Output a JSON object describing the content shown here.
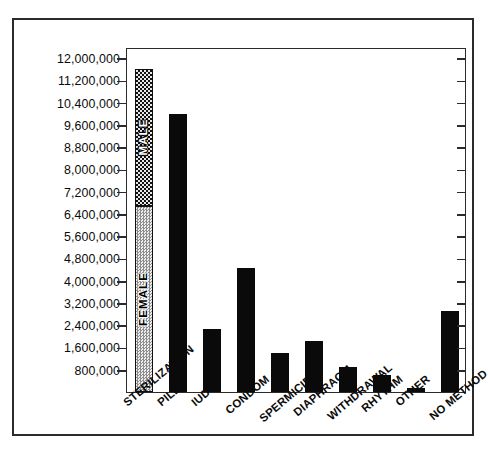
{
  "chart_data": {
    "type": "bar",
    "title": "",
    "subtitle": "",
    "xlabel": "",
    "ylabel": "",
    "grid": false,
    "legend_position": "in-bar",
    "ylim": [
      0,
      12400000
    ],
    "ytick_values": [
      800000,
      1600000,
      2400000,
      3200000,
      4000000,
      4800000,
      5600000,
      6400000,
      7200000,
      8000000,
      8800000,
      9600000,
      10400000,
      11200000,
      12000000
    ],
    "ytick_labels": [
      "800,000",
      "1,600,000",
      "2,400,000",
      "3,200,000",
      "4,000,000",
      "4,800,000",
      "5,600,000",
      "6,400,000",
      "7,200,000",
      "8,000,000",
      "8,800,000",
      "9,600,000",
      "10,400,000",
      "11,200,000",
      "12,000,000"
    ],
    "categories": [
      "STERILIZATION",
      "PILL",
      "IUD",
      "CONDOM",
      "SPERMICIDE",
      "DIAPHRAGM",
      "WITHDRAWAL",
      "RHYTHM",
      "OTHER",
      "NO METHOD"
    ],
    "values": [
      11600000,
      10000000,
      2250000,
      4450000,
      1400000,
      1850000,
      900000,
      620000,
      140000,
      2900000
    ],
    "stacked_first_bar": {
      "category": "STERILIZATION",
      "segments": [
        {
          "name": "FEMALE",
          "value": 6700000,
          "fill": "stipple-light",
          "text_color": "#000000"
        },
        {
          "name": "MALE",
          "value": 4900000,
          "fill": "checker-dark",
          "text_color": "#ffffff"
        }
      ],
      "total": 11600000
    },
    "series": [
      {
        "name": "Users",
        "values": [
          11600000,
          10000000,
          2250000,
          4450000,
          1400000,
          1850000,
          900000,
          620000,
          140000,
          2900000
        ]
      }
    ],
    "annotations": [
      "MALE",
      "FEMALE"
    ],
    "colors": {
      "bar": "#0a0a0a",
      "male": "#2a2a2a",
      "female": "#d2d2d2",
      "axis": "#2b2b2b"
    }
  }
}
